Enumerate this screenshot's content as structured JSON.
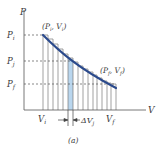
{
  "figure": {
    "caption": "(a)",
    "axes": {
      "x_label": "V",
      "y_label": "P"
    },
    "y_ticks": [
      {
        "label": "P",
        "sub": "i",
        "y": 35
      },
      {
        "label": "P",
        "sub": "j",
        "y": 61
      },
      {
        "label": "P",
        "sub": "f",
        "y": 84
      }
    ],
    "x_ticks": [
      {
        "label": "V",
        "sub": "i",
        "x": 43
      },
      {
        "label": "V",
        "sub": "f",
        "x": 116
      }
    ],
    "points": {
      "initial": {
        "text": "(P",
        "sub1": "i",
        "mid": ", V",
        "sub2": "i",
        "end": ")"
      },
      "final": {
        "text": "(P",
        "sub1": "f",
        "mid": ", V",
        "sub2": "f",
        "end": ")"
      }
    },
    "delta_label": {
      "prefix": "ΔV",
      "sub": "j"
    },
    "colors": {
      "curve": "#2b4a8c",
      "shade": "#b9d6ee",
      "lines": "#6b6b6b",
      "axis": "#555555",
      "text": "#3a3a3a"
    }
  }
}
